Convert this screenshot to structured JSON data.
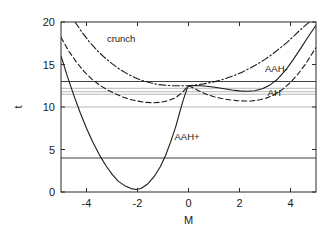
{
  "chart_data": {
    "type": "line",
    "title": "",
    "xlabel": "M",
    "ylabel": "t",
    "xlim": [
      -5,
      5
    ],
    "ylim": [
      0,
      20
    ],
    "grid": false,
    "legend": "none",
    "x_ticks": [
      -4,
      -2,
      0,
      2,
      4
    ],
    "x_tick_labels": [
      "-4",
      "-2",
      "0",
      "2",
      "4"
    ],
    "y_ticks": [
      0,
      5,
      10,
      15,
      20
    ],
    "y_tick_labels": [
      "0",
      "5",
      "10",
      "15",
      "20"
    ],
    "series": [
      {
        "name": "AAH+",
        "label": "AAH+",
        "style": "solid",
        "color": "#1a1a1a",
        "annotation_x": -0.55,
        "annotation_y": 6.1,
        "points": [
          [
            -5.0,
            16.0
          ],
          [
            -4.75,
            13.6
          ],
          [
            -4.5,
            11.4
          ],
          [
            -4.25,
            9.35
          ],
          [
            -4.0,
            7.5
          ],
          [
            -3.75,
            5.85
          ],
          [
            -3.5,
            4.4
          ],
          [
            -3.25,
            3.15
          ],
          [
            -3.0,
            2.1
          ],
          [
            -2.75,
            1.25
          ],
          [
            -2.5,
            0.75
          ],
          [
            -2.25,
            0.4
          ],
          [
            -2.05,
            0.3
          ],
          [
            -1.85,
            0.45
          ],
          [
            -1.6,
            0.95
          ],
          [
            -1.35,
            1.8
          ],
          [
            -1.1,
            3.0
          ],
          [
            -0.9,
            4.3
          ],
          [
            -0.7,
            5.9
          ],
          [
            -0.5,
            7.7
          ],
          [
            -0.35,
            9.3
          ],
          [
            -0.22,
            10.7
          ],
          [
            -0.12,
            11.6
          ],
          [
            -0.05,
            12.2
          ],
          [
            0.0,
            12.5
          ]
        ]
      },
      {
        "name": "AAH-",
        "label": "AAH-",
        "style": "solid",
        "color": "#1a1a1a",
        "annotation_x": 3.0,
        "annotation_y": 14.1,
        "points": [
          [
            0.0,
            12.5
          ],
          [
            0.25,
            12.52
          ],
          [
            0.5,
            12.5
          ],
          [
            0.8,
            12.42
          ],
          [
            1.1,
            12.3
          ],
          [
            1.4,
            12.14
          ],
          [
            1.7,
            12.0
          ],
          [
            2.0,
            11.9
          ],
          [
            2.3,
            11.85
          ],
          [
            2.6,
            11.92
          ],
          [
            2.9,
            12.15
          ],
          [
            3.2,
            12.6
          ],
          [
            3.5,
            13.3
          ],
          [
            3.8,
            14.3
          ],
          [
            4.1,
            15.55
          ],
          [
            4.4,
            16.9
          ],
          [
            4.7,
            18.3
          ],
          [
            5.0,
            19.6
          ]
        ]
      },
      {
        "name": "AH",
        "label": "AH",
        "style": "dashed",
        "color": "#1a1a1a",
        "annotation_x": 3.1,
        "annotation_y": 11.35,
        "points": [
          [
            -5.0,
            18.2
          ],
          [
            -4.7,
            16.6
          ],
          [
            -4.4,
            15.3
          ],
          [
            -4.1,
            14.2
          ],
          [
            -3.8,
            13.3
          ],
          [
            -3.5,
            12.6
          ],
          [
            -3.2,
            12.05
          ],
          [
            -2.9,
            11.6
          ],
          [
            -2.6,
            11.2
          ],
          [
            -2.3,
            10.9
          ],
          [
            -2.0,
            10.7
          ],
          [
            -1.7,
            10.55
          ],
          [
            -1.4,
            10.5
          ],
          [
            -1.1,
            10.55
          ],
          [
            -0.8,
            10.75
          ],
          [
            -0.5,
            11.1
          ],
          [
            -0.25,
            11.7
          ],
          [
            -0.1,
            12.2
          ],
          [
            0.0,
            12.5
          ],
          [
            0.15,
            12.3
          ],
          [
            0.4,
            11.9
          ],
          [
            0.7,
            11.5
          ],
          [
            1.0,
            11.2
          ],
          [
            1.3,
            11.0
          ],
          [
            1.6,
            10.85
          ],
          [
            1.9,
            10.75
          ],
          [
            2.2,
            10.7
          ],
          [
            2.5,
            10.72
          ],
          [
            2.8,
            10.85
          ],
          [
            3.1,
            11.1
          ],
          [
            3.4,
            11.5
          ],
          [
            3.7,
            12.1
          ],
          [
            4.0,
            12.9
          ],
          [
            4.3,
            13.9
          ],
          [
            4.6,
            15.1
          ],
          [
            5.0,
            17.0
          ]
        ]
      },
      {
        "name": "crunch",
        "label": "crunch",
        "style": "dashdot",
        "color": "#1a1a1a",
        "annotation_x": -3.2,
        "annotation_y": 17.7,
        "points": [
          [
            -4.45,
            20.0
          ],
          [
            -4.2,
            18.9
          ],
          [
            -3.9,
            17.7
          ],
          [
            -3.6,
            16.7
          ],
          [
            -3.3,
            15.85
          ],
          [
            -3.0,
            15.1
          ],
          [
            -2.7,
            14.45
          ],
          [
            -2.4,
            13.9
          ],
          [
            -2.1,
            13.45
          ],
          [
            -1.8,
            13.1
          ],
          [
            -1.5,
            12.85
          ],
          [
            -1.2,
            12.65
          ],
          [
            -0.9,
            12.55
          ],
          [
            -0.6,
            12.5
          ],
          [
            -0.3,
            12.5
          ],
          [
            0.0,
            12.5
          ],
          [
            0.3,
            12.6
          ],
          [
            0.6,
            12.72
          ],
          [
            0.9,
            12.9
          ],
          [
            1.2,
            13.1
          ],
          [
            1.5,
            13.4
          ],
          [
            1.8,
            13.7
          ],
          [
            2.1,
            14.1
          ],
          [
            2.4,
            14.55
          ],
          [
            2.7,
            15.05
          ],
          [
            3.0,
            15.6
          ],
          [
            3.3,
            16.25
          ],
          [
            3.6,
            16.95
          ],
          [
            3.9,
            17.7
          ],
          [
            4.2,
            18.55
          ],
          [
            4.5,
            19.4
          ],
          [
            4.75,
            20.0
          ]
        ]
      }
    ],
    "horizontal_lines": [
      {
        "name": "hline-13",
        "t": 13.0,
        "weight": "dark"
      },
      {
        "name": "hline-12-2",
        "t": 12.2,
        "weight": "light"
      },
      {
        "name": "hline-11-8",
        "t": 11.8,
        "weight": "light"
      },
      {
        "name": "hline-11-5",
        "t": 11.5,
        "weight": "light"
      },
      {
        "name": "hline-10",
        "t": 10.0,
        "weight": "light"
      },
      {
        "name": "hline-4",
        "t": 4.0,
        "weight": "dark"
      }
    ]
  }
}
